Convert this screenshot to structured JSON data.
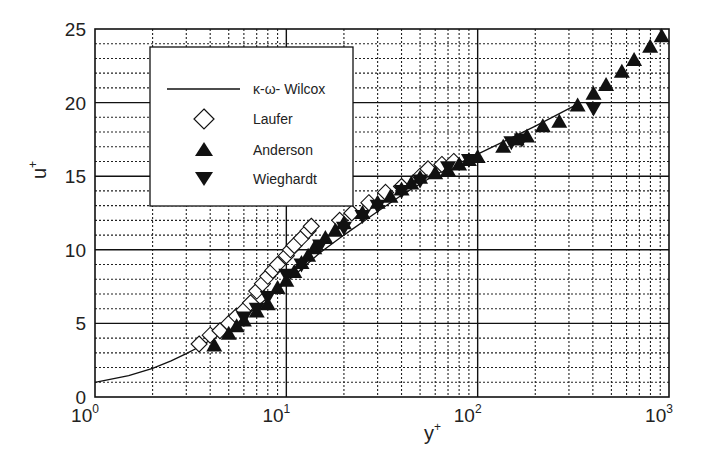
{
  "chart_data": {
    "type": "scatter",
    "title": "",
    "xlabel": "y+",
    "ylabel": "u+",
    "xscale": "log",
    "xlim": [
      1,
      1000
    ],
    "ylim": [
      0,
      25
    ],
    "grid": true,
    "x_ticks": [
      {
        "base": "10",
        "exp": "0",
        "value": 1
      },
      {
        "base": "10",
        "exp": "1",
        "value": 10
      },
      {
        "base": "10",
        "exp": "2",
        "value": 100
      },
      {
        "base": "10",
        "exp": "3",
        "value": 1000
      }
    ],
    "y_ticks": [
      0,
      5,
      10,
      15,
      20,
      25
    ],
    "legend_position": "upper-left (inside)",
    "series": [
      {
        "name": "κ-ω- Wilcox",
        "kind": "line",
        "points": [
          [
            1,
            1.0
          ],
          [
            1.5,
            1.45
          ],
          [
            2,
            1.95
          ],
          [
            2.5,
            2.45
          ],
          [
            3,
            2.95
          ],
          [
            3.5,
            3.4
          ],
          [
            4,
            3.85
          ],
          [
            5,
            4.7
          ],
          [
            6,
            5.45
          ],
          [
            7,
            6.1
          ],
          [
            8,
            6.75
          ],
          [
            9,
            7.3
          ],
          [
            10,
            7.8
          ],
          [
            12,
            8.7
          ],
          [
            15,
            9.8
          ],
          [
            20,
            11.0
          ],
          [
            30,
            12.6
          ],
          [
            40,
            13.7
          ],
          [
            60,
            15.1
          ],
          [
            100,
            16.5
          ],
          [
            150,
            17.6
          ],
          [
            200,
            18.4
          ],
          [
            333,
            19.9
          ]
        ]
      },
      {
        "name": "Laufer",
        "kind": "marker",
        "marker": "open-diamond",
        "points": [
          [
            3.5,
            3.6
          ],
          [
            4,
            4.2
          ],
          [
            4.5,
            4.5
          ],
          [
            5,
            5.0
          ],
          [
            5.5,
            5.5
          ],
          [
            6,
            5.9
          ],
          [
            6.5,
            6.4
          ],
          [
            7,
            7.2
          ],
          [
            7.5,
            7.7
          ],
          [
            8,
            8.2
          ],
          [
            8.5,
            8.6
          ],
          [
            9,
            9.0
          ],
          [
            10,
            9.6
          ],
          [
            10.5,
            10.0
          ],
          [
            11,
            10.3
          ],
          [
            12,
            10.8
          ],
          [
            13,
            11.3
          ],
          [
            13.5,
            11.6
          ],
          [
            19,
            12.0
          ],
          [
            22,
            12.5
          ],
          [
            27,
            13.2
          ],
          [
            33,
            13.9
          ],
          [
            40,
            14.3
          ],
          [
            50,
            15.0
          ],
          [
            55,
            15.5
          ],
          [
            65,
            15.8
          ],
          [
            75,
            16.0
          ]
        ]
      },
      {
        "name": "Anderson",
        "kind": "marker",
        "marker": "filled-triangle-up",
        "points": [
          [
            4.2,
            3.5
          ],
          [
            5,
            4.3
          ],
          [
            5.5,
            4.8
          ],
          [
            6,
            5.2
          ],
          [
            7,
            5.8
          ],
          [
            8,
            6.3
          ],
          [
            9,
            7.4
          ],
          [
            10,
            7.9
          ],
          [
            11,
            8.5
          ],
          [
            12,
            9.1
          ],
          [
            13,
            9.6
          ],
          [
            14,
            10.1
          ],
          [
            16,
            10.8
          ],
          [
            18,
            11.3
          ],
          [
            20,
            11.8
          ],
          [
            25,
            12.5
          ],
          [
            30,
            13.2
          ],
          [
            35,
            13.6
          ],
          [
            40,
            14.1
          ],
          [
            45,
            14.5
          ],
          [
            50,
            14.9
          ],
          [
            60,
            15.2
          ],
          [
            70,
            15.4
          ],
          [
            80,
            15.8
          ],
          [
            90,
            16.1
          ],
          [
            100,
            16.3
          ],
          [
            136,
            17.0
          ],
          [
            160,
            17.5
          ],
          [
            181,
            17.7
          ],
          [
            219,
            18.4
          ],
          [
            267,
            18.7
          ],
          [
            333,
            19.8
          ],
          [
            403,
            20.6
          ],
          [
            469,
            21.2
          ],
          [
            567,
            22.1
          ],
          [
            657,
            22.9
          ],
          [
            797,
            23.8
          ],
          [
            916,
            24.5
          ]
        ]
      },
      {
        "name": "Wieghardt",
        "kind": "marker",
        "marker": "filled-triangle-down",
        "points": [
          [
            6,
            5.4
          ],
          [
            7,
            6.0
          ],
          [
            8,
            6.8
          ],
          [
            10,
            8.3
          ],
          [
            12,
            9.0
          ],
          [
            15,
            10.3
          ],
          [
            20,
            11.5
          ],
          [
            25,
            12.3
          ],
          [
            30,
            13.0
          ],
          [
            40,
            14.0
          ],
          [
            50,
            14.7
          ],
          [
            70,
            15.6
          ],
          [
            90,
            16.1
          ],
          [
            150,
            17.3
          ],
          [
            170,
            17.5
          ],
          [
            403,
            19.6
          ]
        ]
      }
    ]
  },
  "labels": {
    "xlabel_main": "y",
    "xlabel_sup": "+",
    "ylabel_main": "u",
    "ylabel_sup": "+"
  },
  "legend": {
    "entries": [
      {
        "label": "κ-ω- Wilcox",
        "symbol": "line"
      },
      {
        "label": "Laufer",
        "symbol": "open-diamond"
      },
      {
        "label": "Anderson",
        "symbol": "filled-triangle-up"
      },
      {
        "label": "Wieghardt",
        "symbol": "filled-triangle-down"
      }
    ]
  },
  "colors": {
    "ink": "#111111",
    "grid": "#222222",
    "background": "#ffffff"
  }
}
